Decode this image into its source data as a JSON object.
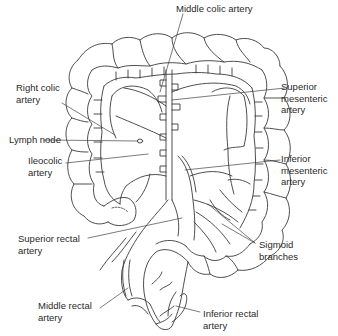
{
  "figure": {
    "line_color": "#3a3a3a",
    "background": "#ffffff"
  },
  "labels": {
    "middle_colic_artery": "Middle colic artery",
    "right_colic_artery": "Right colic\nartery",
    "superior_mesenteric_artery": "Superior\nmesenteric\nartery",
    "lymph_node": "Lymph node",
    "ileocolic_artery": "Ileocolic\nartery",
    "inferior_mesenteric_artery": "Inferior\nmesenteric\nartery",
    "superior_rectal_artery": "Superior rectal\nartery",
    "sigmoid_branches": "Sigmoid\nbranches",
    "middle_rectal_artery": "Middle rectal\nartery",
    "inferior_rectal_artery": "Inferior rectal\nartery"
  }
}
